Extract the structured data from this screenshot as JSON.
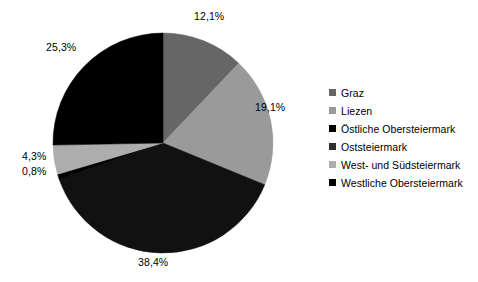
{
  "chart_data": {
    "type": "pie",
    "title": "",
    "subtitle": "",
    "xlabel": "",
    "ylabel": "",
    "legend_position": "right",
    "grid": false,
    "start_angle_deg": 0,
    "direction": "clockwise",
    "value_unit": "%",
    "decimal_separator": ",",
    "categories": [
      "Graz",
      "Liezen",
      "Oststeiermark",
      "Östliche Obersteiermark",
      "West- und Südsteiermark",
      "Westliche Obersteiermark"
    ],
    "values": [
      12.1,
      19.1,
      38.4,
      0.8,
      4.3,
      25.3
    ],
    "slices": [
      {
        "name": "Graz",
        "value": 12.1,
        "label": "12,1%",
        "color": "#666666",
        "order": 1
      },
      {
        "name": "Liezen",
        "value": 19.1,
        "label": "19,1%",
        "color": "#9a9a9a",
        "order": 2
      },
      {
        "name": "Oststeiermark",
        "value": 38.4,
        "label": "38,4%",
        "color": "#111111",
        "order": 3
      },
      {
        "name": "Östliche Obersteiermark",
        "value": 0.8,
        "label": "0,8%",
        "color": "#000000",
        "order": 4
      },
      {
        "name": "West- und Südsteiermark",
        "value": 4.3,
        "label": "4,3%",
        "color": "#adadad",
        "order": 5
      },
      {
        "name": "Westliche Obersteiermark",
        "value": 25.3,
        "label": "25,3%",
        "color": "#000000",
        "order": 6
      }
    ]
  },
  "labels": {
    "graz": "12,1%",
    "liezen": "19,1%",
    "oststeiermark": "38,4%",
    "oestliche_obersteiermark": "0,8%",
    "west_und_suedsteiermark": "4,3%",
    "westliche_obersteiermark": "25,3%"
  },
  "legend": {
    "items": [
      {
        "label": "Graz",
        "color": "#666666"
      },
      {
        "label": "Liezen",
        "color": "#9a9a9a"
      },
      {
        "label": "Östliche Obersteiermark",
        "color": "#000000"
      },
      {
        "label": "Oststeiermark",
        "color": "#2e2e2e"
      },
      {
        "label": "West- und Südsteiermark",
        "color": "#adadad"
      },
      {
        "label": "Westliche Obersteiermark",
        "color": "#000000"
      }
    ]
  }
}
